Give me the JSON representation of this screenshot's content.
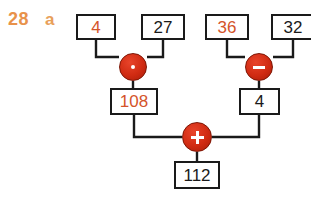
{
  "exercise": {
    "number": "28",
    "part": "a",
    "number_color": "#E8924A",
    "part_color": "#E8A05A"
  },
  "colors": {
    "box_border": "#1a1a1a",
    "wire": "#1a1a1a",
    "operator_fill": "#D02B12",
    "operator_glyph": "#ffffff",
    "highlight_text": "#D4542A",
    "normal_text": "#1a1a1a",
    "background": "#ffffff"
  },
  "diagram": {
    "type": "calculation-tree",
    "inputs": [
      {
        "id": "in-1",
        "value": "4",
        "highlighted": true,
        "x": 76,
        "y": 14,
        "w": 40,
        "h": 26
      },
      {
        "id": "in-2",
        "value": "27",
        "highlighted": false,
        "x": 141,
        "y": 14,
        "w": 44,
        "h": 26
      },
      {
        "id": "in-3",
        "value": "36",
        "highlighted": true,
        "x": 205,
        "y": 14,
        "w": 44,
        "h": 26
      },
      {
        "id": "in-4",
        "value": "32",
        "highlighted": false,
        "x": 271,
        "y": 14,
        "w": 44,
        "h": 26
      }
    ],
    "operators": [
      {
        "id": "op-multiply",
        "symbol": "times",
        "icon": "multiply-dot-icon",
        "cx": 133,
        "cy": 67,
        "r": 14
      },
      {
        "id": "op-subtract",
        "symbol": "minus",
        "icon": "minus-icon",
        "cx": 259,
        "cy": 67,
        "r": 14
      },
      {
        "id": "op-add",
        "symbol": "plus",
        "icon": "plus-icon",
        "cx": 197,
        "cy": 137,
        "r": 15
      }
    ],
    "intermediates": [
      {
        "id": "mid-left",
        "value": "108",
        "highlighted": true,
        "x": 110,
        "y": 88,
        "w": 48,
        "h": 27
      },
      {
        "id": "mid-right",
        "value": "4",
        "highlighted": false,
        "x": 239,
        "y": 88,
        "w": 41,
        "h": 27
      }
    ],
    "result": {
      "id": "result",
      "value": "112",
      "highlighted": false,
      "x": 174,
      "y": 161,
      "w": 46,
      "h": 28
    },
    "equations": [
      "4 · 27 = 108",
      "36 − 32 = 4",
      "108 + 4 = 112"
    ]
  }
}
